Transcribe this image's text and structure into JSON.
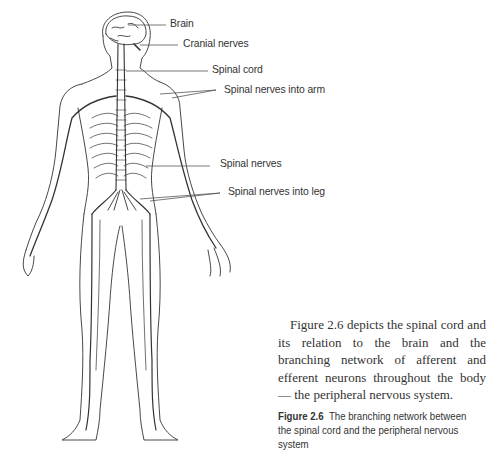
{
  "figure": {
    "illustration": "human-nervous-system-front-view",
    "labels": [
      {
        "text": "Brain"
      },
      {
        "text": "Cranial nerves"
      },
      {
        "text": "Spinal cord"
      },
      {
        "text": "Spinal nerves into arm"
      },
      {
        "text": "Spinal nerves"
      },
      {
        "text": "Spinal nerves into leg"
      }
    ]
  },
  "body_text": "Figure 2.6 depicts the spinal cord and its relation to the brain and the branching network of afferent and efferent neurons throughout the body — the peripheral nervous system.",
  "caption": {
    "number": "Figure 2.6",
    "text": "The branching network between the spinal cord and the peripheral nervous system"
  }
}
